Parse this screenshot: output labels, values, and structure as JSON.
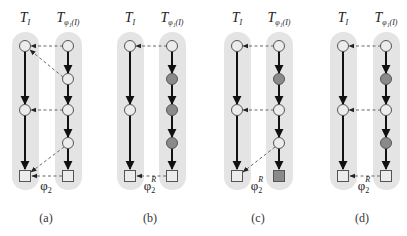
{
  "figure": {
    "panels": [
      {
        "id": "a",
        "caption": "(a)",
        "left_label": "T",
        "left_sub": "I",
        "right_label": "T",
        "right_sub": "φ₁(I)",
        "map_label": "φ",
        "map_sub": "2",
        "map_sup": "",
        "right_nodes": [
          "circle",
          "circle",
          "circle",
          "circle",
          "square"
        ],
        "right_filled": [
          false,
          false,
          false,
          false,
          false
        ],
        "mappings": "dashed arrows from right tree to left tree"
      },
      {
        "id": "b",
        "caption": "(b)",
        "left_label": "T",
        "left_sub": "I",
        "right_label": "T",
        "right_sub": "φ₁(I)",
        "map_label": "φ",
        "map_sub": "2",
        "map_sup": "R",
        "right_nodes": [
          "circle",
          "circle",
          "circle",
          "circle",
          "square"
        ],
        "right_filled": [
          false,
          true,
          true,
          true,
          false
        ]
      },
      {
        "id": "c",
        "caption": "(c)",
        "left_label": "T",
        "left_sub": "I",
        "right_label": "T",
        "right_sub": "φ₁(I)",
        "map_label": "φ",
        "map_sub": "2",
        "map_sup": "R",
        "right_nodes": [
          "circle",
          "circle",
          "circle",
          "circle",
          "square"
        ],
        "right_filled": [
          false,
          true,
          false,
          false,
          true
        ]
      },
      {
        "id": "d",
        "caption": "(d)",
        "left_label": "T",
        "left_sub": "I",
        "right_label": "T",
        "right_sub": "φ₁(I)",
        "map_label": "φ",
        "map_sub": "2",
        "map_sup": "R",
        "right_nodes": [
          "circle",
          "circle",
          "circle",
          "circle",
          "square"
        ],
        "right_filled": [
          false,
          true,
          false,
          true,
          false
        ]
      }
    ],
    "colors": {
      "pill_background": "#e4e4e4",
      "node_fill": "#ececec",
      "node_filled": "#8a8a8a",
      "edge": "#111111",
      "mapping": "#666666"
    }
  }
}
